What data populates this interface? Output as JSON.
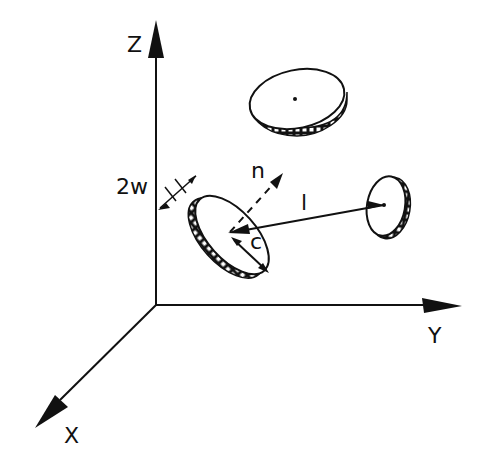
{
  "diagram": {
    "type": "3d-coordinate-schematic",
    "axes": {
      "z": {
        "label": "Z"
      },
      "y": {
        "label": "Y"
      },
      "x": {
        "label": "X"
      }
    },
    "annotations": {
      "thickness": "2w",
      "normal": "n",
      "separation": "l",
      "radius": "c"
    },
    "discs": [
      {
        "id": "top-disc",
        "description": "horizontal disc with center dot"
      },
      {
        "id": "left-disc",
        "description": "tilted disc with normal n, radius c, thickness 2w"
      },
      {
        "id": "right-disc",
        "description": "edge-on disc at end of vector l"
      }
    ],
    "colors": {
      "ink": "#111111",
      "background": "#ffffff"
    }
  }
}
